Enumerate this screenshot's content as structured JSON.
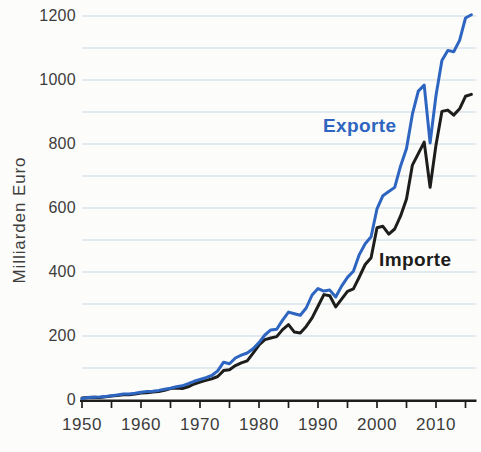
{
  "colors": {
    "exporte_line": "#2d65c0",
    "importe_line": "#1d1d1b",
    "grid": "#c8d8e2",
    "axis": "#1d1d1b",
    "text": "#3d3d3b",
    "background": "#fcfcfb"
  },
  "chart_data": {
    "type": "line",
    "title": "",
    "xlabel": "",
    "ylabel": "Milliarden Euro",
    "grid": true,
    "legend": "inline-labels",
    "y_axis": {
      "title": "Milliarden Euro",
      "tick_values": [
        0,
        200,
        400,
        600,
        800,
        1000,
        1200
      ],
      "tick_labels": [
        "0",
        "200",
        "400",
        "600",
        "800",
        "1000",
        "1200"
      ],
      "gridline_step": 100,
      "range": [
        0,
        1200
      ]
    },
    "x_axis": {
      "tick_label_values": [
        1950,
        1960,
        1970,
        1980,
        1990,
        2000,
        2010
      ],
      "tick_labels": [
        "1950",
        "1960",
        "1970",
        "1980",
        "1990",
        "2000",
        "2010"
      ],
      "minor_tick_step": 5,
      "tick_range": [
        1950,
        2015
      ],
      "range": [
        1950,
        2016
      ]
    },
    "x": [
      1950,
      1951,
      1952,
      1953,
      1954,
      1955,
      1956,
      1957,
      1958,
      1959,
      1960,
      1961,
      1962,
      1963,
      1964,
      1965,
      1966,
      1967,
      1968,
      1969,
      1970,
      1971,
      1972,
      1973,
      1974,
      1975,
      1976,
      1977,
      1978,
      1979,
      1980,
      1981,
      1982,
      1983,
      1984,
      1985,
      1986,
      1987,
      1988,
      1989,
      1990,
      1991,
      1992,
      1993,
      1994,
      1995,
      1996,
      1997,
      1998,
      1999,
      2000,
      2001,
      2002,
      2003,
      2004,
      2005,
      2006,
      2007,
      2008,
      2009,
      2010,
      2011,
      2012,
      2013,
      2014,
      2015,
      2016
    ],
    "series": [
      {
        "name": "Exporte",
        "color": "#2d65c0",
        "values": [
          4.3,
          7.5,
          8.7,
          9.5,
          11.2,
          13.1,
          15.8,
          18.4,
          19.0,
          21.0,
          24.5,
          26.1,
          27.1,
          29.9,
          33.4,
          36.6,
          41.3,
          44.5,
          50.8,
          58.3,
          64.0,
          69.6,
          76.6,
          91.2,
          118.2,
          113.0,
          131.1,
          140.2,
          146.9,
          160.1,
          179.3,
          203.0,
          219.0,
          220.9,
          249.6,
          274.6,
          269.8,
          264.9,
          287.5,
          328.0,
          348.1,
          340.4,
          343.3,
          322.0,
          355.8,
          383.2,
          402.4,
          454.3,
          488.4,
          510.0,
          597.4,
          638.3,
          651.3,
          664.5,
          731.5,
          786.3,
          893.0,
          965.2,
          984.1,
          803.3,
          951.9,
          1061.2,
          1092.6,
          1088.0,
          1123.7,
          1193.6,
          1203.8
        ]
      },
      {
        "name": "Importe",
        "color": "#1d1d1b",
        "values": [
          5.8,
          7.6,
          8.3,
          8.2,
          9.9,
          12.5,
          14.1,
          16.2,
          16.2,
          18.3,
          21.8,
          22.7,
          25.0,
          26.7,
          30.0,
          35.8,
          37.1,
          35.8,
          41.2,
          50.0,
          56.2,
          61.1,
          65.8,
          73.5,
          91.9,
          94.6,
          107.6,
          115.8,
          122.6,
          146.6,
          172.0,
          188.7,
          193.6,
          198.0,
          220.1,
          235.6,
          212.1,
          209.6,
          229.9,
          256.7,
          293.2,
          329.3,
          325.8,
          290.8,
          315.4,
          339.6,
          347.3,
          384.5,
          423.5,
          444.8,
          538.3,
          542.8,
          518.5,
          534.5,
          575.4,
          628.1,
          734.0,
          769.9,
          805.8,
          664.6,
          797.1,
          902.0,
          905.9,
          890.4,
          910.1,
          949.2,
          954.9
        ]
      }
    ]
  }
}
